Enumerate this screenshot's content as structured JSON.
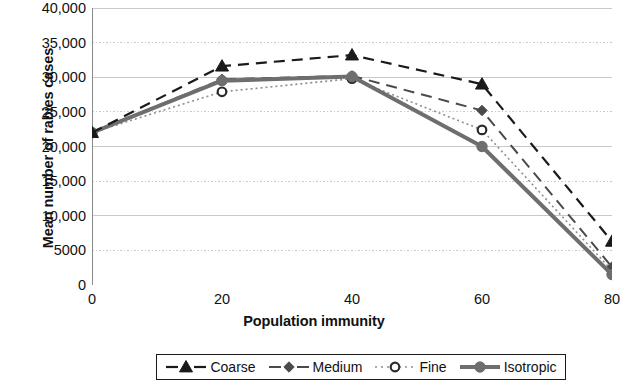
{
  "chart_data": {
    "type": "line",
    "title": "",
    "xlabel": "Population immunity",
    "ylabel": "Mean number of rabies cases",
    "x": [
      0,
      20,
      40,
      60,
      80
    ],
    "xlim": [
      0,
      80
    ],
    "ylim": [
      0,
      40000
    ],
    "xticks": [
      "0",
      "20",
      "40",
      "60",
      "80"
    ],
    "yticks": [
      "0",
      "5000",
      "10,000",
      "15,000",
      "20,000",
      "25,000",
      "30,000",
      "35,000",
      "40,000"
    ],
    "ytick_values": [
      0,
      5000,
      10000,
      15000,
      20000,
      25000,
      30000,
      35000,
      40000
    ],
    "grid": true,
    "grid_axis": "y",
    "legend_position": "bottom",
    "series": [
      {
        "name": "Coarse",
        "values": [
          22000,
          31600,
          33200,
          29000,
          6300
        ],
        "color": "#1a1a1a",
        "linestyle": "dashed",
        "marker": "triangle",
        "linewidth": 2.2
      },
      {
        "name": "Medium",
        "values": [
          22000,
          29700,
          30200,
          25200,
          2600
        ],
        "color": "#4a4a4a",
        "linestyle": "dashed",
        "marker": "diamond",
        "linewidth": 2.0
      },
      {
        "name": "Fine",
        "values": [
          22000,
          27900,
          29800,
          22400,
          2100
        ],
        "color": "#8f8f8f",
        "linestyle": "dotted",
        "marker": "circle-open",
        "linewidth": 1.6
      },
      {
        "name": "Isotropic",
        "values": [
          22000,
          29500,
          30100,
          20000,
          1500
        ],
        "color": "#6e6e6e",
        "linestyle": "solid",
        "marker": "circle-filled",
        "linewidth": 4.0
      }
    ]
  },
  "legend": {
    "items": [
      {
        "label": "Coarse"
      },
      {
        "label": "Medium"
      },
      {
        "label": "Fine"
      },
      {
        "label": "Isotropic"
      }
    ]
  },
  "colors": {
    "axis": "#8a8a8a",
    "grid": "#c9c9c9",
    "text": "#111111",
    "background": "#ffffff"
  }
}
